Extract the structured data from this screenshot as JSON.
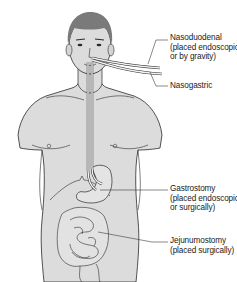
{
  "figure": {
    "labels": [
      {
        "id": "nasoduodenal",
        "title": "Nasoduodenal",
        "line2": "(placed endoscopically",
        "line3": "or by gravity)"
      },
      {
        "id": "nasogastric",
        "title": "Nasogastric"
      },
      {
        "id": "gastrostomy",
        "title": "Gastrostomy",
        "line2": "(placed endoscopically",
        "line3": "or surgically)"
      },
      {
        "id": "jejunumostomy",
        "title": "Jejunumostomy",
        "line2": "(placed surgically)"
      }
    ],
    "colors": {
      "skin": "#dcdcdc",
      "hair": "#7a7a7a",
      "outline": "#2a2a2a",
      "tube": "#f2f2f2",
      "background": "#ffffff"
    }
  }
}
